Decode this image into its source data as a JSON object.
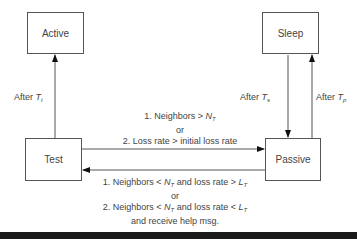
{
  "states": {
    "active": "Active",
    "sleep": "Sleep",
    "test": "Test",
    "passive": "Passive"
  },
  "transitions": {
    "test_to_active": {
      "prefix": "After ",
      "var": "T",
      "sub": "t"
    },
    "sleep_to_passive": {
      "prefix": "After ",
      "var": "T",
      "sub": "s"
    },
    "passive_to_sleep": {
      "prefix": "After ",
      "var": "T",
      "sub": "p"
    },
    "test_to_passive": {
      "line1_prefix": "1. Neighbors > ",
      "line1_var": "N",
      "line1_sub": "T",
      "or": "or",
      "line2": "2. Loss rate > initial loss rate"
    },
    "passive_to_test": {
      "line1_prefix": "1. Neighbors < ",
      "line1_var": "N",
      "line1_sub": "T",
      "line1_mid": " and loss rate > ",
      "line1_var2": "L",
      "line1_sub2": "T",
      "or": "or",
      "line2_prefix": "2. Neighbors < ",
      "line2_var": "N",
      "line2_sub": "T",
      "line2_mid": " and loss rate < ",
      "line2_var2": "L",
      "line2_sub2": "T",
      "line3": "and receive help msg."
    }
  }
}
